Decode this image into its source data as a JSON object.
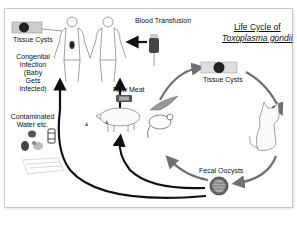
{
  "title": {
    "line1": "Life Cycle of",
    "line2": "Toxoplasma gondii"
  },
  "labels": {
    "tissue_cysts_human": "Tissue Cysts",
    "blood_transfusion": "Blood Transfusion",
    "congenital": [
      "Congenital",
      "Infection",
      "(Baby",
      "Gets",
      "Infected)"
    ],
    "contaminated_water": [
      "Contaminated",
      "Water etc."
    ],
    "raw_meat": "Raw Meat",
    "tissue_cysts_cycle": "Tissue Cysts",
    "fecal_oocysts": "Fecal Oocysts"
  },
  "colors": {
    "arrow_dark": "#111111",
    "arrow_gray": "#707070",
    "frame_border": "#c8c8c8"
  },
  "icons": [
    "human-figure-icon",
    "blood-bag-icon",
    "tissue-cyst-icon",
    "cat-icon",
    "mouse-icon",
    "bird-icon",
    "pig-icon",
    "oocyst-icon",
    "produce-icon",
    "water-container-icon",
    "meat-package-icon",
    "fly-icon"
  ]
}
